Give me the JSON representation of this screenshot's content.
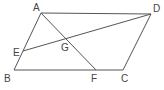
{
  "diagram": {
    "type": "parallelogram-geometry",
    "line_color": "#555555",
    "label_color": "#444444",
    "points": {
      "A": {
        "label": "A",
        "x": 41,
        "y": 13
      },
      "B": {
        "label": "B",
        "x": 14,
        "y": 70
      },
      "C": {
        "label": "C",
        "x": 123,
        "y": 70
      },
      "D": {
        "label": "D",
        "x": 151,
        "y": 14
      },
      "E": {
        "label": "E",
        "x": 23,
        "y": 51
      },
      "F": {
        "label": "F",
        "x": 96,
        "y": 70
      },
      "G": {
        "label": "G",
        "x": 66,
        "y": 38
      }
    },
    "segments": [
      [
        "A",
        "D"
      ],
      [
        "D",
        "C"
      ],
      [
        "C",
        "B"
      ],
      [
        "B",
        "A"
      ],
      [
        "A",
        "F"
      ],
      [
        "E",
        "D"
      ]
    ]
  }
}
